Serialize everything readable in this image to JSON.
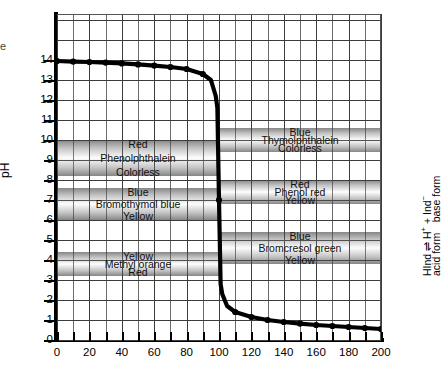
{
  "axes": {
    "ylabel": "pH",
    "yticks": [
      0,
      1,
      2,
      3,
      4,
      5,
      6,
      7,
      8,
      9,
      10,
      11,
      12,
      13,
      14
    ],
    "xticks": [
      0,
      20,
      40,
      60,
      80,
      100,
      120,
      140,
      160,
      180,
      200
    ],
    "xlim": [
      0,
      200
    ],
    "ylim": [
      0,
      16.3
    ]
  },
  "stray_glyph": "e",
  "right_annotation": {
    "equation_line": "HInd ⇌ H⁺ + Ind⁻",
    "form_line": "acid form   base form",
    "equation_parts": {
      "hind": "HInd",
      "arrow": "⇌",
      "h_plus": "H",
      "h_sup": "+",
      "plus": "+",
      "ind": "Ind",
      "ind_sup": "−"
    },
    "acid_form": "acid form",
    "base_form": "base form"
  },
  "indicators": {
    "left": [
      {
        "name": "Phenolphthalein",
        "base_color_label": "Red",
        "acid_color_label": "Colorless",
        "ph_low": 8.2,
        "ph_high": 10.0,
        "x_start": 0,
        "x_end": 100
      },
      {
        "name": "Bromothymol blue",
        "base_color_label": "Blue",
        "acid_color_label": "Yellow",
        "ph_low": 6.0,
        "ph_high": 7.6,
        "x_start": 0,
        "x_end": 100
      },
      {
        "name": "Methyl orange",
        "base_color_label": "Yellow",
        "acid_color_label": "Red",
        "ph_low": 3.2,
        "ph_high": 4.4,
        "x_start": 0,
        "x_end": 100
      }
    ],
    "right": [
      {
        "name": "Thymolphthalein",
        "base_color_label": "Blue",
        "acid_color_label": "Colorless",
        "ph_low": 9.4,
        "ph_high": 10.6,
        "x_start": 100,
        "x_end": 200
      },
      {
        "name": "Phenol red",
        "base_color_label": "Red",
        "acid_color_label": "Yellow",
        "ph_low": 6.8,
        "ph_high": 8.0,
        "x_start": 100,
        "x_end": 200
      },
      {
        "name": "Bromcresol green",
        "base_color_label": "Blue",
        "acid_color_label": "Yellow",
        "ph_low": 3.8,
        "ph_high": 5.4,
        "x_start": 100,
        "x_end": 200
      }
    ]
  },
  "chart_data": {
    "type": "line",
    "title": "",
    "xlabel": "",
    "ylabel": "pH",
    "xlim": [
      0,
      200
    ],
    "ylim": [
      0,
      16.3
    ],
    "grid": true,
    "legend": null,
    "series": [
      {
        "name": "Titration of strong base with strong acid",
        "marker": "circle",
        "x": [
          0,
          10,
          20,
          30,
          40,
          50,
          60,
          70,
          80,
          90,
          95,
          98,
          99,
          100,
          101,
          102,
          105,
          110,
          120,
          130,
          140,
          150,
          160,
          170,
          180,
          190,
          200
        ],
        "y": [
          13.95,
          13.92,
          13.9,
          13.87,
          13.83,
          13.78,
          13.72,
          13.65,
          13.55,
          13.3,
          13.0,
          12.2,
          11.6,
          7.0,
          2.8,
          2.3,
          1.7,
          1.4,
          1.15,
          1.0,
          0.9,
          0.82,
          0.75,
          0.7,
          0.65,
          0.6,
          0.55
        ]
      }
    ],
    "equivalence_point": {
      "x": 100,
      "y": 7.0
    },
    "annotations": [
      "Red",
      "Phenolphthalein",
      "Colorless",
      "Blue",
      "Bromothymol blue",
      "Yellow",
      "Yellow",
      "Methyl orange",
      "Red",
      "Blue",
      "Thymolphthalein",
      "Colorless",
      "Red",
      "Phenol red",
      "Yellow",
      "Blue",
      "Bromcresol green",
      "Yellow"
    ]
  }
}
